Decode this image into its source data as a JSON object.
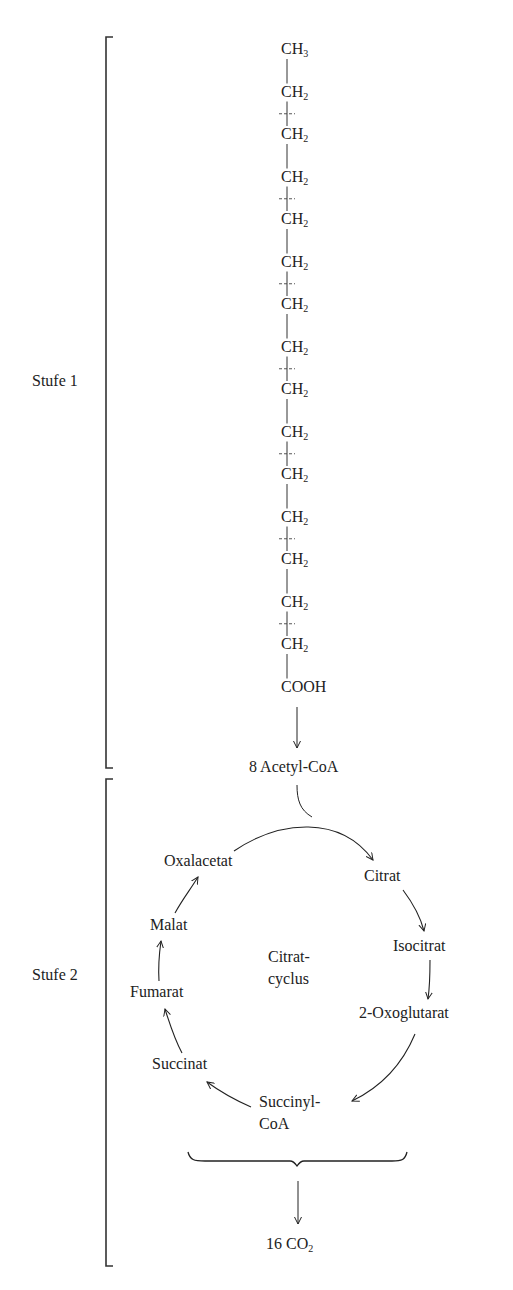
{
  "diagram": {
    "stages": [
      {
        "label": "Stufe 1"
      },
      {
        "label": "Stufe 2"
      }
    ],
    "chain": {
      "top": {
        "base": "CH",
        "sub": "3"
      },
      "repeat_unit": {
        "base": "CH",
        "sub": "2"
      },
      "repeat_count": 14,
      "bottom": "COOH",
      "cleavage_marks_after_units": [
        1,
        3,
        5,
        7,
        9,
        11,
        13
      ]
    },
    "product_stage1": "8 Acetyl-CoA",
    "cycle": {
      "center_label_line1": "Citrat-",
      "center_label_line2": "cyclus",
      "intermediates": [
        "Citrat",
        "Isocitrat",
        "2-Oxoglutarat",
        "Succinyl-",
        "CoA",
        "Succinat",
        "Fumarat",
        "Malat",
        "Oxalacetat"
      ]
    },
    "final_product": {
      "prefix": "16 CO",
      "sub": "2"
    }
  }
}
